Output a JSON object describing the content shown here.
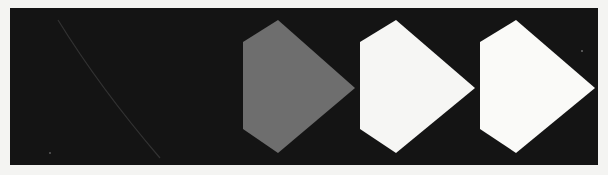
{
  "image": {
    "description": "Photograph of a dark panel showing a sequence of three pentagon-shaped arrow markers pointing right, progressing from grey to white",
    "background_color": "#f4f4f2",
    "panel_color": "#141414",
    "streak_color": "#3a3a3a"
  },
  "shapes": [
    {
      "name": "grey-pentagon-arrow",
      "fill": "#6e6e6e",
      "points": "233,34 277,79 345,79 345,79 277,79",
      "label": "Shape 1"
    },
    {
      "name": "white-pentagon-arrow-middle",
      "fill": "#f6f6f4",
      "label": "Shape 2"
    },
    {
      "name": "white-pentagon-arrow-right",
      "fill": "#fafaf8",
      "label": "Shape 3"
    }
  ],
  "caption": "Three arrow-shaped pentagons on dark background"
}
